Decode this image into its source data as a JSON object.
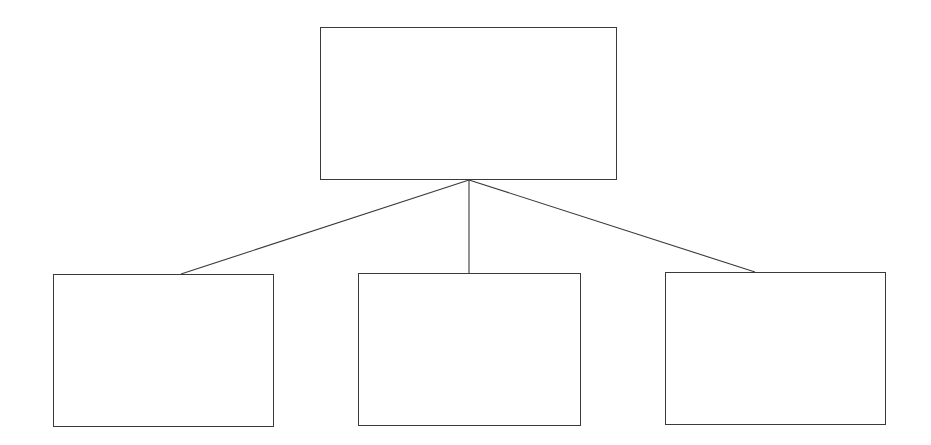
{
  "diagram": {
    "type": "tree",
    "stroke_color": "#3a3a3a",
    "background": "#ffffff",
    "root": {
      "label": "",
      "x": 320,
      "y": 27,
      "w": 297,
      "h": 152
    },
    "children": [
      {
        "label": "",
        "x": 53,
        "y": 274,
        "w": 220,
        "h": 152
      },
      {
        "label": "",
        "x": 358,
        "y": 273,
        "w": 222,
        "h": 152
      },
      {
        "label": "",
        "x": 665,
        "y": 272,
        "w": 220,
        "h": 152
      }
    ],
    "connectors": [
      {
        "x1": 469,
        "y1": 180,
        "x2": 181,
        "y2": 274
      },
      {
        "x1": 469,
        "y1": 180,
        "x2": 469,
        "y2": 273
      },
      {
        "x1": 469,
        "y1": 180,
        "x2": 755,
        "y2": 272
      }
    ]
  }
}
